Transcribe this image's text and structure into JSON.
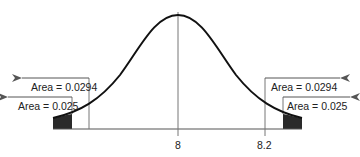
{
  "diagram": {
    "type": "normal-distribution-curve",
    "mean_label": "8",
    "cutoff_label": "8.2",
    "annotations": {
      "left_outer": "Area = 0.0294",
      "left_inner": "Area = 0.025",
      "right_outer": "Area = 0.0294",
      "right_inner": "Area = 0.025"
    },
    "colors": {
      "curve": "#111111",
      "shade": "#2a2a2a",
      "lines": "#666666",
      "background": "#ffffff"
    }
  }
}
